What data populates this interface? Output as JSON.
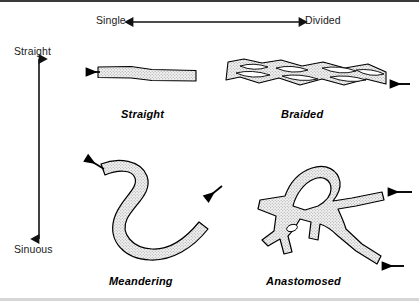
{
  "diagram": {
    "background_color": "#ffffff",
    "outline_color": "#000000",
    "fill_color": "#e8e8e8",
    "border_top_color": "#3a3a3a",
    "border_bottom_color": "#d6d6d6"
  },
  "axes": {
    "horizontal": {
      "name": "channel-division-axis",
      "left_label": "Single",
      "right_label": "Divided",
      "arrow": "double-headed"
    },
    "vertical": {
      "name": "channel-sinuosity-axis",
      "top_label": "Straight",
      "bottom_label": "Sinuous",
      "arrow": "double-headed"
    }
  },
  "figures": [
    {
      "id": "straight",
      "label": "Straight",
      "row": "top",
      "column": "left",
      "sinuosity": "Straight",
      "division": "Single",
      "flow_arrows": 1
    },
    {
      "id": "braided",
      "label": "Braided",
      "row": "top",
      "column": "right",
      "sinuosity": "Straight",
      "division": "Divided",
      "flow_arrows": 1
    },
    {
      "id": "meandering",
      "label": "Meandering",
      "row": "bottom",
      "column": "left",
      "sinuosity": "Sinuous",
      "division": "Single",
      "flow_arrows": 2
    },
    {
      "id": "anastomosed",
      "label": "Anastomosed",
      "row": "bottom",
      "column": "right",
      "sinuosity": "Sinuous",
      "division": "Divided",
      "flow_arrows": 2
    }
  ]
}
